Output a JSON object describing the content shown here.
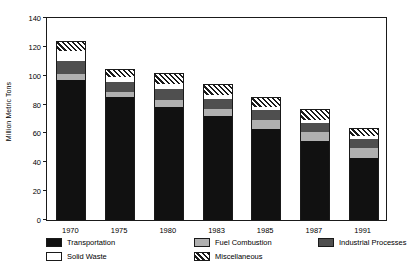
{
  "chart_data": {
    "type": "bar",
    "stacked": true,
    "title": "",
    "xlabel": "",
    "ylabel": "Million Metric Tons",
    "ylim": [
      0,
      140
    ],
    "yticks": [
      0,
      20,
      40,
      60,
      80,
      100,
      120,
      140
    ],
    "ytick_labels": [
      "0",
      "20",
      "40",
      "60",
      "80",
      "100",
      "120",
      "140"
    ],
    "grid": false,
    "legend_position": "below",
    "categories": [
      "1970",
      "1975",
      "1980",
      "1983",
      "1985",
      "1987",
      "1991"
    ],
    "series": [
      {
        "name": "Transportation",
        "key": "transportation",
        "color": "#111111",
        "pattern": "solid",
        "values": [
          97,
          85,
          78,
          72,
          63,
          55,
          43
        ]
      },
      {
        "name": "Fuel Combustion",
        "key": "fuel",
        "color": "#b0b0b0",
        "pattern": "solid",
        "values": [
          4,
          4,
          5,
          5,
          6,
          6,
          7
        ]
      },
      {
        "name": "Industrial Processes",
        "key": "industrial",
        "color": "#4f4f4f",
        "pattern": "solid",
        "values": [
          9,
          7,
          8,
          7,
          7,
          6,
          6
        ]
      },
      {
        "name": "Solid Waste",
        "key": "solid",
        "color": "#ffffff",
        "pattern": "solid",
        "values": [
          7,
          3,
          3,
          3,
          2,
          2,
          2
        ]
      },
      {
        "name": "Miscellaneous",
        "key": "misc",
        "color": "#ffffff",
        "pattern": "diagonal-hatch",
        "values": [
          7,
          6,
          8,
          7,
          7,
          8,
          6
        ]
      }
    ],
    "totals": [
      124,
      105,
      102,
      94,
      85,
      77,
      64
    ]
  },
  "legend": {
    "entries": [
      {
        "label": "Transportation",
        "key": "transportation"
      },
      {
        "label": "Fuel Combustion",
        "key": "fuel"
      },
      {
        "label": "Industrial Processes",
        "key": "industrial"
      },
      {
        "label": "Solid Waste",
        "key": "solid"
      },
      {
        "label": "Miscellaneous",
        "key": "misc"
      }
    ]
  }
}
